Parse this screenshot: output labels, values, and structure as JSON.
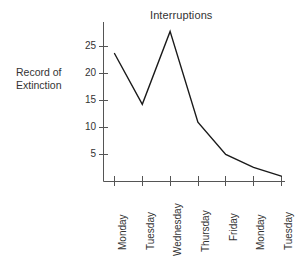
{
  "chart_data": {
    "type": "line",
    "title": "Interruptions",
    "xlabel": "",
    "ylabel": "Record of Extinction",
    "ylabel_lines": [
      "Record of",
      "Extinction"
    ],
    "categories": [
      "Monday",
      "Tuesday",
      "Wednesday",
      "Thursday",
      "Friday",
      "Monday",
      "Tuesday"
    ],
    "values": [
      23.7,
      14.3,
      27.8,
      11.0,
      5.0,
      2.6,
      1.0
    ],
    "yticks": [
      5,
      10,
      15,
      20,
      25
    ],
    "ytick_labels": [
      "5",
      "10",
      "15",
      "20",
      "25"
    ],
    "ylim": [
      0,
      29
    ],
    "grid": false,
    "legend": null,
    "line_color": "#1a1a1a",
    "axis_color": "#555555",
    "background": "#ffffff"
  },
  "figure": {
    "title": "Interruptions",
    "y_axis_caption_line1": "Record of",
    "y_axis_caption_line2": "Extinction"
  }
}
